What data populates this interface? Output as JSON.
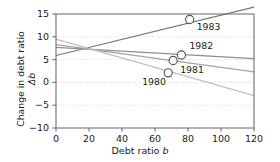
{
  "chart_data": {
    "type": "scatter",
    "title": "",
    "xlabel": "Debt ratio b",
    "ylabel": "Change in debt ratio Δb",
    "xlabel_plain": "Debt ratio",
    "xlabel_italic": "b",
    "ylabel_plain": "Change in debt ratio",
    "ylabel_italic": "Δb",
    "xlim": [
      0,
      120
    ],
    "ylim": [
      -10,
      15
    ],
    "xticks": [
      0,
      20,
      40,
      60,
      80,
      100,
      120
    ],
    "yticks": [
      15,
      10,
      5,
      0,
      -5,
      -10
    ],
    "xtick_labels": [
      "0",
      "20",
      "40",
      "60",
      "80",
      "100",
      "120"
    ],
    "ytick_labels": [
      "15",
      "10",
      "5",
      "0",
      "−5",
      "−10"
    ],
    "grid": true,
    "grid_style": "dotted",
    "legend": "none",
    "points": [
      {
        "label": "1980",
        "x": 68,
        "y": 2.1,
        "marker": "open-circle",
        "label_dx": -26,
        "label_dy": 10
      },
      {
        "label": "1981",
        "x": 71,
        "y": 4.8,
        "marker": "open-circle",
        "label_dx": 7,
        "label_dy": 10
      },
      {
        "label": "1982",
        "x": 76,
        "y": 6.0,
        "marker": "open-circle",
        "label_dx": 8,
        "label_dy": -8
      },
      {
        "label": "1983",
        "x": 81,
        "y": 13.8,
        "marker": "open-circle",
        "label_dx": 7,
        "label_dy": 9
      }
    ],
    "series": [
      {
        "name": "1983",
        "type": "line",
        "color": "#77777a",
        "x": [
          0,
          120
        ],
        "values": [
          5.9,
          16.5
        ]
      },
      {
        "name": "1982",
        "type": "line",
        "color": "#8e8e92",
        "x": [
          0,
          120
        ],
        "values": [
          7.7,
          5.2
        ]
      },
      {
        "name": "1981",
        "type": "line",
        "color": "#a2a2a6",
        "x": [
          0,
          120
        ],
        "values": [
          8.3,
          2.3
        ]
      },
      {
        "name": "1980",
        "type": "line",
        "color": "#c0c0c4",
        "x": [
          0,
          120
        ],
        "values": [
          9.5,
          -2.9
        ]
      }
    ],
    "colors": {
      "axis": "#6f6f73",
      "grid": "#b9b9d0",
      "marker_edge": "#55555a",
      "text": "#1a1a1a",
      "background": "#ffffff"
    }
  }
}
